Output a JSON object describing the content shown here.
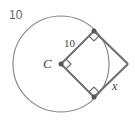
{
  "problem_number": "10",
  "labels": {
    "radius": "10",
    "center": "C",
    "unknown": "x"
  },
  "geometry": {
    "circle": {
      "cx": 61,
      "cy": 64,
      "r": 48
    },
    "center_point": {
      "x": 61,
      "y": 64
    },
    "tangent_point_top": {
      "x": 94,
      "y": 31
    },
    "tangent_point_bottom": {
      "x": 94,
      "y": 97
    },
    "outer_vertex": {
      "x": 128,
      "y": 64
    }
  },
  "colors": {
    "stroke": "#777777",
    "circle_stroke": "#888888",
    "point_fill": "#555555",
    "text": "#444444"
  }
}
